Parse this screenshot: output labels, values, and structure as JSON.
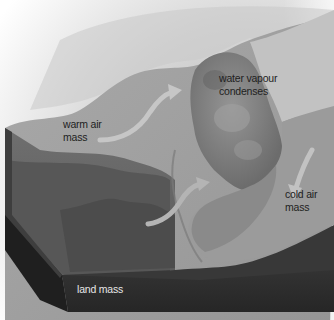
{
  "diagram": {
    "type": "3D block cross-section of a weather front",
    "palette": {
      "background": "#ffffff",
      "sky_top": "#f2f2f2",
      "warm_air": "#a6a6a6",
      "warm_air_front_face": "#6e6e6e",
      "cloud": "#7d7d7d",
      "cold_air": "#9a9a9a",
      "cold_air_face": "#8c8c8c",
      "land_top": "#4a4a4a",
      "land_front": "#2c2c2c",
      "land_side": "#1f1f1f",
      "arrow": "#c4c4c4",
      "label_dark": "#1e1e1e",
      "label_light": "#e6e6e6"
    },
    "labels": {
      "warm_air": {
        "line1": "warm air",
        "line2": "mass"
      },
      "water_vapour": {
        "line1": "water vapour",
        "line2": "condenses"
      },
      "cold_air": {
        "line1": "cold air",
        "line2": "mass"
      },
      "land": {
        "line1": "land mass"
      }
    },
    "arrows": [
      {
        "name": "warm-air-rising-arrow",
        "direction": "up-right"
      },
      {
        "name": "warm-air-lower-arrow",
        "direction": "up-right"
      },
      {
        "name": "cold-air-sinking-arrow",
        "direction": "down-left"
      }
    ]
  }
}
